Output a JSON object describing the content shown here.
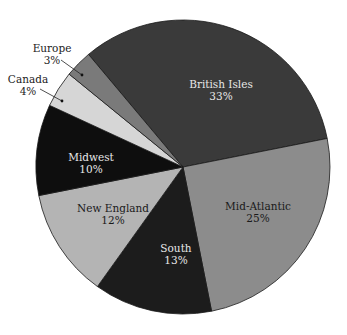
{
  "chart_data": {
    "type": "pie",
    "title": "",
    "start_angle_deg": -130,
    "direction": "clockwise",
    "center": [
      183,
      167
    ],
    "radius": 147,
    "slices": [
      {
        "label": "British Isles",
        "value": 33,
        "pct_label": "33%",
        "color": "#3a3a3a",
        "text_color": "#e8e8e8",
        "label_pos": [
          221,
          88
        ],
        "outside": false
      },
      {
        "label": "Mid-Atlantic",
        "value": 25,
        "pct_label": "25%",
        "color": "#8c8c8c",
        "text_color": "#1a1a1a",
        "label_pos": [
          258,
          210
        ],
        "outside": false
      },
      {
        "label": "South",
        "value": 13,
        "pct_label": "13%",
        "color": "#1c1c1c",
        "text_color": "#e8e8e8",
        "label_pos": [
          176,
          252
        ],
        "outside": false
      },
      {
        "label": "New England",
        "value": 12,
        "pct_label": "12%",
        "color": "#b4b4b4",
        "text_color": "#1a1a1a",
        "label_pos": [
          113,
          212
        ],
        "outside": false
      },
      {
        "label": "Midwest",
        "value": 10,
        "pct_label": "10%",
        "color": "#0e0e0e",
        "text_color": "#e8e8e8",
        "label_pos": [
          91,
          161
        ],
        "outside": false
      },
      {
        "label": "Canada",
        "value": 4,
        "pct_label": "4%",
        "color": "#d6d6d6",
        "text_color": "#222222",
        "label_pos": [
          28,
          83
        ],
        "outside": true,
        "leader": [
          [
            40,
            89
          ],
          [
            62,
            101
          ]
        ]
      },
      {
        "label": "Europe",
        "value": 3,
        "pct_label": "3%",
        "color": "#7a7a7a",
        "text_color": "#222222",
        "label_pos": [
          52,
          52
        ],
        "outside": true,
        "leader": [
          [
            61,
            60
          ],
          [
            82,
            75
          ]
        ]
      }
    ],
    "legend": "none"
  }
}
